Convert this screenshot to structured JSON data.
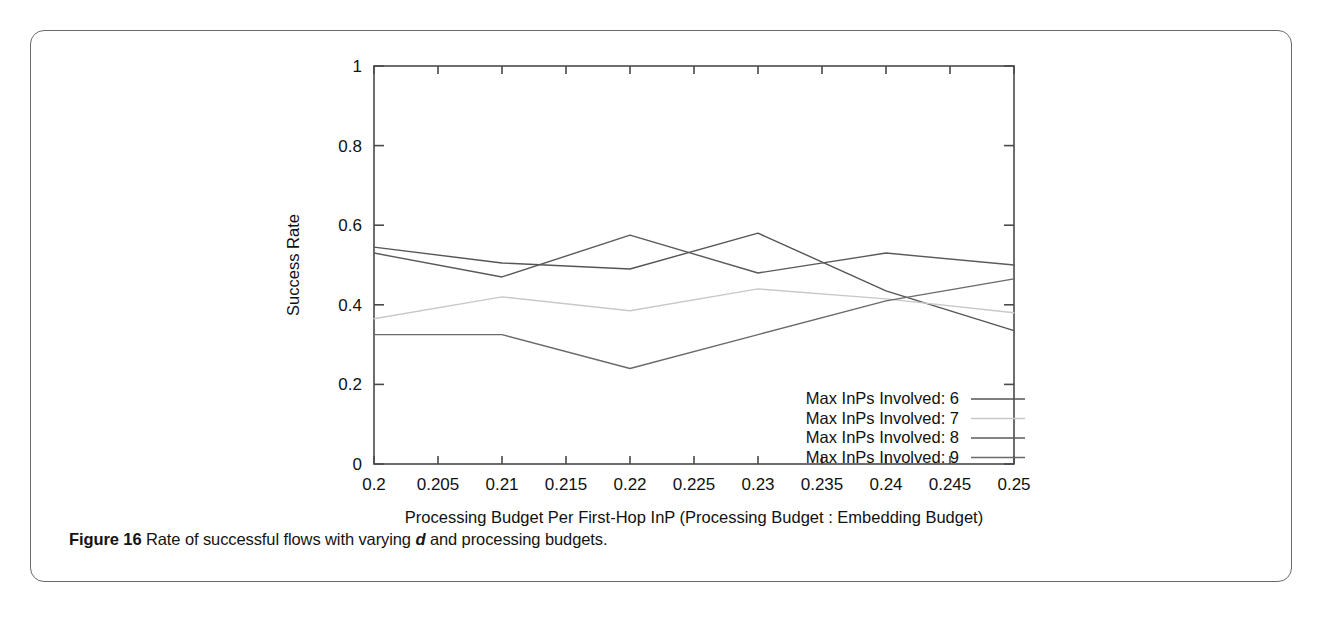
{
  "figure": {
    "caption_label": "Figure 16",
    "caption_text_before": "Rate of successful flows with varying",
    "caption_emphasis": "d",
    "caption_text_after": "and processing budgets."
  },
  "chart_data": {
    "type": "line",
    "title": "",
    "xlabel": "Processing Budget Per First-Hop InP (Processing Budget : Embedding Budget)",
    "ylabel": "Success Rate",
    "xlim": [
      0.2,
      0.25
    ],
    "ylim": [
      0,
      1
    ],
    "grid": false,
    "legend_position": "inside-bottom-right",
    "xticks": [
      "0.2",
      "0.205",
      "0.21",
      "0.215",
      "0.22",
      "0.225",
      "0.23",
      "0.235",
      "0.24",
      "0.245",
      "0.25"
    ],
    "xtick_values": [
      0.2,
      0.205,
      0.21,
      0.215,
      0.22,
      0.225,
      0.23,
      0.235,
      0.24,
      0.245,
      0.25
    ],
    "yticks": [
      "0",
      "0.2",
      "0.4",
      "0.6",
      "0.8",
      "1"
    ],
    "ytick_values": [
      0,
      0.2,
      0.4,
      0.6,
      0.8,
      1
    ],
    "x": [
      0.2,
      0.21,
      0.22,
      0.23,
      0.24,
      0.25
    ],
    "series": [
      {
        "name": "Max InPs Involved: 6",
        "color": "#555555",
        "values": [
          0.545,
          0.505,
          0.49,
          0.58,
          0.435,
          0.335
        ]
      },
      {
        "name": "Max InPs Involved: 7",
        "color": "#c8c8c8",
        "values": [
          0.365,
          0.42,
          0.385,
          0.44,
          0.415,
          0.38
        ]
      },
      {
        "name": "Max InPs Involved: 8",
        "color": "#5a5a5a",
        "values": [
          0.53,
          0.47,
          0.575,
          0.48,
          0.53,
          0.5
        ]
      },
      {
        "name": "Max InPs Involved: 9",
        "color": "#6a6a6a",
        "values": [
          0.325,
          0.325,
          0.24,
          0.325,
          0.41,
          0.465
        ]
      }
    ],
    "legend": [
      "Max InPs Involved: 6",
      "Max InPs Involved: 7",
      "Max InPs Involved: 8",
      "Max InPs Involved: 9"
    ]
  }
}
